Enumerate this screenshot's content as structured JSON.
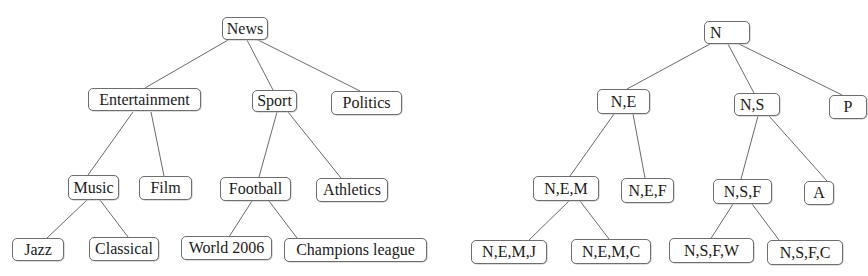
{
  "trees": [
    {
      "id": "named-tree",
      "nodes": [
        {
          "key": "news",
          "label": "News",
          "x": 222,
          "y": 17,
          "w": 46,
          "h": 23
        },
        {
          "key": "entertainment",
          "label": "Entertainment",
          "x": 88,
          "y": 88,
          "w": 113,
          "h": 23
        },
        {
          "key": "sport",
          "label": "Sport",
          "x": 252,
          "y": 90,
          "w": 45,
          "h": 22
        },
        {
          "key": "politics",
          "label": "Politics",
          "x": 331,
          "y": 91,
          "w": 71,
          "h": 24
        },
        {
          "key": "music",
          "label": "Music",
          "x": 68,
          "y": 175,
          "w": 51,
          "h": 25
        },
        {
          "key": "film",
          "label": "Film",
          "x": 139,
          "y": 176,
          "w": 53,
          "h": 24
        },
        {
          "key": "football",
          "label": "Football",
          "x": 220,
          "y": 177,
          "w": 71,
          "h": 24
        },
        {
          "key": "athletics",
          "label": "Athletics",
          "x": 316,
          "y": 178,
          "w": 72,
          "h": 24
        },
        {
          "key": "jazz",
          "label": "Jazz",
          "x": 12,
          "y": 238,
          "w": 52,
          "h": 23
        },
        {
          "key": "classical",
          "label": "Classical",
          "x": 89,
          "y": 237,
          "w": 70,
          "h": 24
        },
        {
          "key": "world2006",
          "label": "World 2006",
          "x": 181,
          "y": 236,
          "w": 91,
          "h": 24
        },
        {
          "key": "champions",
          "label": "Champions league",
          "x": 284,
          "y": 238,
          "w": 143,
          "h": 24
        }
      ],
      "edges": [
        {
          "from": "news",
          "to": "entertainment",
          "x1": 228,
          "y1": 40,
          "x2": 145,
          "y2": 88
        },
        {
          "from": "news",
          "to": "sport",
          "x1": 247,
          "y1": 40,
          "x2": 273,
          "y2": 90
        },
        {
          "from": "news",
          "to": "politics",
          "x1": 256,
          "y1": 39,
          "x2": 360,
          "y2": 91
        },
        {
          "from": "entertainment",
          "to": "music",
          "x1": 133,
          "y1": 112,
          "x2": 88,
          "y2": 175
        },
        {
          "from": "entertainment",
          "to": "film",
          "x1": 151,
          "y1": 112,
          "x2": 164,
          "y2": 176
        },
        {
          "from": "sport",
          "to": "football",
          "x1": 277,
          "y1": 112,
          "x2": 259,
          "y2": 177
        },
        {
          "from": "sport",
          "to": "athletics",
          "x1": 288,
          "y1": 112,
          "x2": 341,
          "y2": 178
        },
        {
          "from": "music",
          "to": "jazz",
          "x1": 87,
          "y1": 200,
          "x2": 47,
          "y2": 238
        },
        {
          "from": "music",
          "to": "classical",
          "x1": 100,
          "y1": 200,
          "x2": 128,
          "y2": 237
        },
        {
          "from": "football",
          "to": "world2006",
          "x1": 252,
          "y1": 201,
          "x2": 227,
          "y2": 240
        },
        {
          "from": "football",
          "to": "champions",
          "x1": 269,
          "y1": 201,
          "x2": 297,
          "y2": 238
        }
      ]
    },
    {
      "id": "abbreviated-tree",
      "nodes": [
        {
          "key": "n",
          "label": "N",
          "x": 704,
          "y": 21,
          "w": 46,
          "h": 23,
          "align": "left"
        },
        {
          "key": "ne",
          "label": "N,E",
          "x": 597,
          "y": 89,
          "w": 53,
          "h": 25
        },
        {
          "key": "ns",
          "label": "N,S",
          "x": 734,
          "y": 93,
          "w": 46,
          "h": 23,
          "align": "left"
        },
        {
          "key": "p",
          "label": "P",
          "x": 829,
          "y": 95,
          "w": 38,
          "h": 24
        },
        {
          "key": "nem",
          "label": "N,E,M",
          "x": 533,
          "y": 176,
          "w": 66,
          "h": 25
        },
        {
          "key": "nef",
          "label": "N,E,F",
          "x": 621,
          "y": 178,
          "w": 53,
          "h": 25
        },
        {
          "key": "nsf",
          "label": "N,S,F",
          "x": 713,
          "y": 179,
          "w": 59,
          "h": 25
        },
        {
          "key": "a",
          "label": "A",
          "x": 804,
          "y": 181,
          "w": 30,
          "h": 24
        },
        {
          "key": "nemj",
          "label": "N,E,M,J",
          "x": 471,
          "y": 240,
          "w": 76,
          "h": 24
        },
        {
          "key": "nemc",
          "label": "N,E,M,C",
          "x": 571,
          "y": 239,
          "w": 80,
          "h": 25
        },
        {
          "key": "nsfw",
          "label": "N,S,F,W",
          "x": 669,
          "y": 238,
          "w": 85,
          "h": 25
        },
        {
          "key": "nsfc",
          "label": "N,S,F,C",
          "x": 767,
          "y": 240,
          "w": 76,
          "h": 25
        }
      ],
      "edges": [
        {
          "from": "n",
          "to": "ne",
          "x1": 710,
          "y1": 44,
          "x2": 627,
          "y2": 89
        },
        {
          "from": "n",
          "to": "ns",
          "x1": 728,
          "y1": 44,
          "x2": 754,
          "y2": 93
        },
        {
          "from": "n",
          "to": "p",
          "x1": 737,
          "y1": 43,
          "x2": 842,
          "y2": 95
        },
        {
          "from": "ne",
          "to": "nem",
          "x1": 614,
          "y1": 114,
          "x2": 570,
          "y2": 176
        },
        {
          "from": "ne",
          "to": "nef",
          "x1": 633,
          "y1": 114,
          "x2": 645,
          "y2": 178
        },
        {
          "from": "ns",
          "to": "nsf",
          "x1": 758,
          "y1": 116,
          "x2": 741,
          "y2": 179
        },
        {
          "from": "ns",
          "to": "a",
          "x1": 769,
          "y1": 116,
          "x2": 827,
          "y2": 181
        },
        {
          "from": "nem",
          "to": "nemj",
          "x1": 569,
          "y1": 201,
          "x2": 529,
          "y2": 240
        },
        {
          "from": "nem",
          "to": "nemc",
          "x1": 580,
          "y1": 201,
          "x2": 609,
          "y2": 239
        },
        {
          "from": "nsf",
          "to": "nsfw",
          "x1": 733,
          "y1": 204,
          "x2": 710,
          "y2": 240
        },
        {
          "from": "nsf",
          "to": "nsfc",
          "x1": 752,
          "y1": 204,
          "x2": 779,
          "y2": 240
        }
      ]
    }
  ]
}
